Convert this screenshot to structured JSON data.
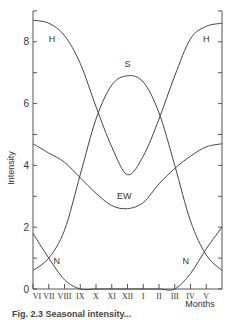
{
  "chart_data": {
    "type": "line",
    "title": "",
    "xlabel": "Months",
    "ylabel": "Intensity",
    "categories": [
      "VI",
      "VII",
      "VIII",
      "IX",
      "X",
      "XI",
      "XII",
      "I",
      "II",
      "III",
      "IV",
      "V",
      ""
    ],
    "x_tick_labels": [
      "VI",
      "VII",
      "VIII",
      "IX",
      "X",
      "XI",
      "XII",
      "I",
      "II",
      "III",
      "IV",
      "V"
    ],
    "y_ticks": [
      0,
      2,
      4,
      6,
      8
    ],
    "y_tick_labels": [
      "0",
      "2",
      "4",
      "6",
      "8"
    ],
    "ylim": [
      0,
      9.0
    ],
    "grid": false,
    "legend": "inline labels",
    "series": [
      {
        "name": "H",
        "label_pos": [
          [
            1.2,
            8.0
          ],
          [
            11.0,
            8.0
          ]
        ],
        "values": [
          8.7,
          8.6,
          8.2,
          7.3,
          5.9,
          4.6,
          3.7,
          4.3,
          5.5,
          6.9,
          8.1,
          8.5,
          8.6
        ]
      },
      {
        "name": "S",
        "label_pos": [
          [
            6.0,
            7.2
          ]
        ],
        "values": [
          0.6,
          1.0,
          1.9,
          3.7,
          5.5,
          6.6,
          6.9,
          6.7,
          5.7,
          4.0,
          2.2,
          1.1,
          0.6
        ]
      },
      {
        "name": "EW",
        "label_pos": [
          [
            5.8,
            2.9
          ]
        ],
        "values": [
          4.7,
          4.4,
          4.1,
          3.6,
          3.1,
          2.7,
          2.6,
          2.8,
          3.4,
          3.9,
          4.3,
          4.6,
          4.7
        ]
      },
      {
        "name": "N",
        "label_pos": [
          [
            1.5,
            0.8
          ],
          [
            9.7,
            0.8
          ]
        ],
        "values": [
          1.8,
          1.0,
          0.3,
          0.0,
          0.0,
          0.0,
          0.0,
          0.0,
          0.0,
          0.0,
          0.5,
          1.3,
          2.0
        ]
      }
    ]
  },
  "caption": "Fig. 2.3  Seasonal intensity..."
}
